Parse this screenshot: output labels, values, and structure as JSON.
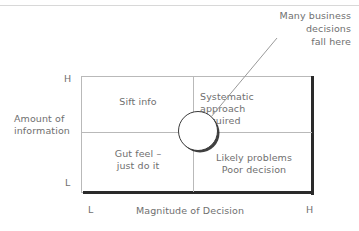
{
  "diagram": {
    "title_annotation": "Many business\ndecisions\nfall here",
    "axes": {
      "y_title": "Amount of\ninformation",
      "x_title": "Magnitude of Decision",
      "y_high": "H",
      "y_low": "L",
      "x_low": "L",
      "x_high": "H"
    },
    "quadrants": [
      {
        "id": "top-left",
        "label": "Sift info"
      },
      {
        "id": "top-right",
        "label": "Systematic\napproach\nrequired"
      },
      {
        "id": "bottom-left",
        "label": "Gut feel –\njust do it"
      },
      {
        "id": "bottom-right",
        "label": "Likely problems\nPoor decision"
      }
    ],
    "highlight": {
      "shape": "circle-marker",
      "center_x": 198,
      "center_y": 131,
      "radius": 20
    },
    "colors": {
      "text": "#6f6f6f",
      "grid": "#b9b9b9",
      "shadow": "#2a2a2a",
      "background": "#ffffff"
    }
  }
}
